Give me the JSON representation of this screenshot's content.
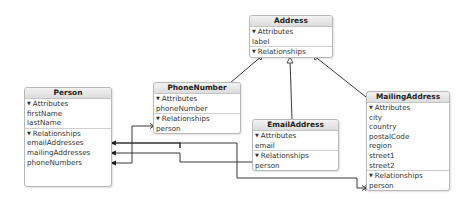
{
  "diagram": {
    "type": "Core Data entity relationship model",
    "entities": {
      "address": {
        "name": "Address",
        "attributes_label": "Attributes",
        "attributes": [
          "label"
        ],
        "relationships_label": "Relationships",
        "relationships": []
      },
      "phone_number": {
        "name": "PhoneNumber",
        "attributes_label": "Attributes",
        "attributes": [
          "phoneNumber"
        ],
        "relationships_label": "Relationships",
        "relationships": [
          "person"
        ]
      },
      "email_address": {
        "name": "EmailAddress",
        "attributes_label": "Attributes",
        "attributes": [
          "email"
        ],
        "relationships_label": "Relationships",
        "relationships": [
          "person"
        ]
      },
      "mailing_address": {
        "name": "MailingAddress",
        "attributes_label": "Attributes",
        "attributes": [
          "city",
          "country",
          "postalCode",
          "region",
          "street1",
          "street2"
        ],
        "relationships_label": "Relationships",
        "relationships": [
          "person"
        ]
      },
      "person": {
        "name": "Person",
        "attributes_label": "Attributes",
        "attributes": [
          "firstName",
          "lastName"
        ],
        "relationships_label": "Relationships",
        "relationships": [
          "emailAddresses",
          "mailingAddresses",
          "phoneNumbers"
        ]
      }
    },
    "inheritance": [
      {
        "child": "PhoneNumber",
        "parent": "Address"
      },
      {
        "child": "EmailAddress",
        "parent": "Address"
      },
      {
        "child": "MailingAddress",
        "parent": "Address"
      }
    ],
    "relationships": [
      {
        "from": "Person.emailAddresses",
        "to": "EmailAddress.person"
      },
      {
        "from": "Person.mailingAddresses",
        "to": "MailingAddress.person"
      },
      {
        "from": "Person.phoneNumbers",
        "to": "PhoneNumber.person"
      }
    ],
    "colors": {
      "line": "#222222",
      "border": "#b8b8b8",
      "header_top": "#f2f2f2",
      "header_bottom": "#dcdcdc"
    },
    "section_toggle_icon": "disclosure-triangle-down"
  }
}
